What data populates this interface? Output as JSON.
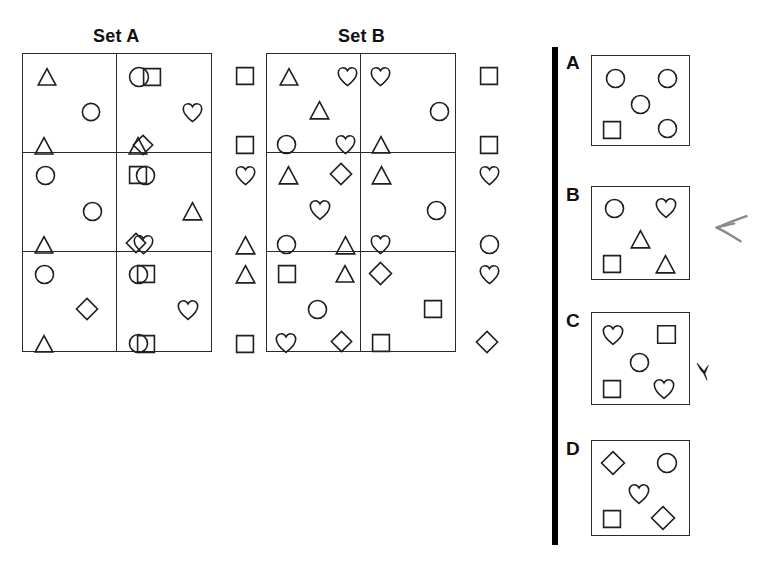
{
  "page": {
    "type": "abstract-reasoning-matrix-question",
    "background_color": "#ffffff",
    "ink_color": "#1f1f1f"
  },
  "sets": [
    {
      "id": "set-a",
      "label": "Set A",
      "label_x": 93,
      "label_y": 26,
      "box": {
        "x": 22,
        "y": 53,
        "w": 190,
        "h": 299
      },
      "cells": [
        {
          "row": 1,
          "col": 1,
          "shapes": [
            {
              "type": "triangle",
              "x": 14,
              "y": 13,
              "size": 20
            },
            {
              "type": "square",
              "x": 119,
              "y": 13,
              "size": 20
            },
            {
              "type": "circle",
              "x": 58,
              "y": 48,
              "size": 20
            },
            {
              "type": "triangle",
              "x": 11,
              "y": 82,
              "size": 20
            },
            {
              "type": "diamond",
              "x": 109,
              "y": 80,
              "size": 22
            }
          ]
        },
        {
          "row": 1,
          "col": 2,
          "shapes": [
            {
              "type": "circle",
              "x": 11,
              "y": 12,
              "size": 22
            },
            {
              "type": "square",
              "x": 118,
              "y": 12,
              "size": 20
            },
            {
              "type": "heart",
              "x": 65,
              "y": 48,
              "size": 21
            },
            {
              "type": "triangle",
              "x": 11,
              "y": 82,
              "size": 20
            },
            {
              "type": "square",
              "x": 118,
              "y": 81,
              "size": 20
            }
          ]
        },
        {
          "row": 2,
          "col": 1,
          "shapes": [
            {
              "type": "circle",
              "x": 12,
              "y": 12,
              "size": 21
            },
            {
              "type": "circle",
              "x": 112,
              "y": 12,
              "size": 21
            },
            {
              "type": "circle",
              "x": 59,
              "y": 48,
              "size": 21
            },
            {
              "type": "triangle",
              "x": 11,
              "y": 82,
              "size": 20
            },
            {
              "type": "heart",
              "x": 110,
              "y": 81,
              "size": 21
            }
          ]
        },
        {
          "row": 2,
          "col": 2,
          "shapes": [
            {
              "type": "square",
              "x": 11,
              "y": 12,
              "size": 20
            },
            {
              "type": "heart",
              "x": 118,
              "y": 12,
              "size": 21
            },
            {
              "type": "triangle",
              "x": 65,
              "y": 48,
              "size": 21
            },
            {
              "type": "diamond",
              "x": 8,
              "y": 79,
              "size": 22
            },
            {
              "type": "triangle",
              "x": 118,
              "y": 82,
              "size": 21
            }
          ]
        },
        {
          "row": 3,
          "col": 1,
          "shapes": [
            {
              "type": "circle",
              "x": 11,
              "y": 12,
              "size": 21
            },
            {
              "type": "square",
              "x": 113,
              "y": 12,
              "size": 20
            },
            {
              "type": "diamond",
              "x": 52,
              "y": 45,
              "size": 24
            },
            {
              "type": "triangle",
              "x": 11,
              "y": 82,
              "size": 20
            },
            {
              "type": "square",
              "x": 113,
              "y": 82,
              "size": 20
            }
          ]
        },
        {
          "row": 3,
          "col": 2,
          "shapes": [
            {
              "type": "circle",
              "x": 11,
              "y": 12,
              "size": 21
            },
            {
              "type": "triangle",
              "x": 118,
              "y": 12,
              "size": 21
            },
            {
              "type": "heart",
              "x": 60,
              "y": 47,
              "size": 22
            },
            {
              "type": "circle",
              "x": 11,
              "y": 81,
              "size": 21
            },
            {
              "type": "square",
              "x": 118,
              "y": 82,
              "size": 20
            }
          ]
        }
      ]
    },
    {
      "id": "set-b",
      "label": "Set B",
      "label_x": 338,
      "label_y": 26,
      "box": {
        "x": 266,
        "y": 53,
        "w": 190,
        "h": 299
      },
      "cells": [
        {
          "row": 1,
          "col": 1,
          "shapes": [
            {
              "type": "triangle",
              "x": 12,
              "y": 13,
              "size": 20
            },
            {
              "type": "heart",
              "x": 70,
              "y": 12,
              "size": 21
            },
            {
              "type": "triangle",
              "x": 42,
              "y": 46,
              "size": 21
            },
            {
              "type": "circle",
              "x": 9,
              "y": 80,
              "size": 21
            },
            {
              "type": "heart",
              "x": 68,
              "y": 80,
              "size": 21
            }
          ]
        },
        {
          "row": 1,
          "col": 2,
          "shapes": [
            {
              "type": "heart",
              "x": 9,
              "y": 12,
              "size": 21
            },
            {
              "type": "square",
              "x": 118,
              "y": 12,
              "size": 20
            },
            {
              "type": "circle",
              "x": 68,
              "y": 47,
              "size": 21
            },
            {
              "type": "triangle",
              "x": 10,
              "y": 81,
              "size": 20
            },
            {
              "type": "square",
              "x": 118,
              "y": 81,
              "size": 20
            }
          ]
        },
        {
          "row": 2,
          "col": 1,
          "shapes": [
            {
              "type": "triangle",
              "x": 11,
              "y": 12,
              "size": 21
            },
            {
              "type": "diamond",
              "x": 62,
              "y": 9,
              "size": 24
            },
            {
              "type": "heart",
              "x": 42,
              "y": 46,
              "size": 22
            },
            {
              "type": "circle",
              "x": 9,
              "y": 81,
              "size": 21
            },
            {
              "type": "triangle",
              "x": 68,
              "y": 82,
              "size": 21
            }
          ]
        },
        {
          "row": 2,
          "col": 2,
          "shapes": [
            {
              "type": "triangle",
              "x": 10,
              "y": 12,
              "size": 21
            },
            {
              "type": "heart",
              "x": 118,
              "y": 12,
              "size": 21
            },
            {
              "type": "circle",
              "x": 65,
              "y": 47,
              "size": 21
            },
            {
              "type": "heart",
              "x": 9,
              "y": 81,
              "size": 21
            },
            {
              "type": "circle",
              "x": 118,
              "y": 81,
              "size": 21
            }
          ]
        },
        {
          "row": 3,
          "col": 1,
          "shapes": [
            {
              "type": "square",
              "x": 10,
              "y": 12,
              "size": 20
            },
            {
              "type": "triangle",
              "x": 68,
              "y": 12,
              "size": 20
            },
            {
              "type": "circle",
              "x": 40,
              "y": 47,
              "size": 21
            },
            {
              "type": "heart",
              "x": 8,
              "y": 80,
              "size": 22
            },
            {
              "type": "diamond",
              "x": 63,
              "y": 78,
              "size": 23
            }
          ]
        },
        {
          "row": 3,
          "col": 2,
          "shapes": [
            {
              "type": "diamond",
              "x": 7,
              "y": 9,
              "size": 25
            },
            {
              "type": "heart",
              "x": 118,
              "y": 12,
              "size": 21
            },
            {
              "type": "square",
              "x": 62,
              "y": 47,
              "size": 20
            },
            {
              "type": "square",
              "x": 10,
              "y": 81,
              "size": 20
            },
            {
              "type": "diamond",
              "x": 114,
              "y": 78,
              "size": 24
            }
          ]
        }
      ]
    }
  ],
  "divider": {
    "x": 552,
    "y": 47,
    "w": 6,
    "h": 498,
    "color": "#000000"
  },
  "options": [
    {
      "letter": "A",
      "letter_x": 566,
      "letter_y": 52,
      "box": {
        "x": 591,
        "y": 55,
        "w": 99,
        "h": 91
      },
      "shapes": [
        {
          "type": "circle",
          "x": 13,
          "y": 12,
          "size": 21
        },
        {
          "type": "circle",
          "x": 65,
          "y": 12,
          "size": 21
        },
        {
          "type": "circle",
          "x": 38,
          "y": 38,
          "size": 21
        },
        {
          "type": "square",
          "x": 10,
          "y": 64,
          "size": 20
        },
        {
          "type": "circle",
          "x": 65,
          "y": 62,
          "size": 21
        }
      ]
    },
    {
      "letter": "B",
      "letter_x": 566,
      "letter_y": 184,
      "box": {
        "x": 591,
        "y": 186,
        "w": 99,
        "h": 94
      },
      "shapes": [
        {
          "type": "circle",
          "x": 12,
          "y": 11,
          "size": 21
        },
        {
          "type": "heart",
          "x": 63,
          "y": 10,
          "size": 22
        },
        {
          "type": "triangle",
          "x": 38,
          "y": 42,
          "size": 21
        },
        {
          "type": "square",
          "x": 10,
          "y": 67,
          "size": 20
        },
        {
          "type": "triangle",
          "x": 63,
          "y": 67,
          "size": 21
        }
      ]
    },
    {
      "letter": "C",
      "letter_x": 566,
      "letter_y": 310,
      "box": {
        "x": 591,
        "y": 312,
        "w": 99,
        "h": 93
      },
      "shapes": [
        {
          "type": "heart",
          "x": 10,
          "y": 11,
          "size": 22
        },
        {
          "type": "square",
          "x": 64,
          "y": 11,
          "size": 21
        },
        {
          "type": "circle",
          "x": 37,
          "y": 39,
          "size": 21
        },
        {
          "type": "square",
          "x": 10,
          "y": 66,
          "size": 20
        },
        {
          "type": "heart",
          "x": 61,
          "y": 65,
          "size": 22
        }
      ]
    },
    {
      "letter": "D",
      "letter_x": 566,
      "letter_y": 438,
      "box": {
        "x": 591,
        "y": 440,
        "w": 99,
        "h": 96
      },
      "shapes": [
        {
          "type": "diamond",
          "x": 8,
          "y": 9,
          "size": 26
        },
        {
          "type": "circle",
          "x": 64,
          "y": 11,
          "size": 22
        },
        {
          "type": "heart",
          "x": 36,
          "y": 42,
          "size": 22
        },
        {
          "type": "square",
          "x": 10,
          "y": 68,
          "size": 20
        },
        {
          "type": "diamond",
          "x": 58,
          "y": 64,
          "size": 26
        }
      ]
    }
  ],
  "marks": [
    {
      "name": "arrow-annotation",
      "icon": "arrow-left-handdrawn",
      "x": 703,
      "y": 210,
      "w": 56,
      "h": 34,
      "color": "#8a8a8a"
    },
    {
      "name": "check-annotation",
      "icon": "check-bird-mark",
      "x": 695,
      "y": 360,
      "w": 20,
      "h": 22,
      "color": "#141414"
    }
  ]
}
